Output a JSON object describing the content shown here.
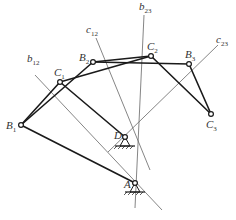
{
  "diagram": {
    "colors": {
      "link": "#1a1a1a",
      "construction": "#666666",
      "label": "#333333",
      "background": "#ffffff"
    },
    "points": {
      "B1": {
        "name": "B",
        "sub": "1",
        "x": 21,
        "y": 125
      },
      "C1": {
        "name": "C",
        "sub": "1",
        "x": 60,
        "y": 82
      },
      "B2": {
        "name": "B",
        "sub": "2",
        "x": 93,
        "y": 62
      },
      "C2": {
        "name": "C",
        "sub": "2",
        "x": 151,
        "y": 56
      },
      "B3": {
        "name": "B",
        "sub": "3",
        "x": 189,
        "y": 64
      },
      "C3": {
        "name": "C",
        "sub": "3",
        "x": 211,
        "y": 114
      },
      "D": {
        "name": "D",
        "sub": "",
        "x": 125,
        "y": 137
      },
      "A": {
        "name": "A",
        "sub": "",
        "x": 135,
        "y": 183
      }
    },
    "links": [
      {
        "from": "B1",
        "to": "C1",
        "type": "coupler"
      },
      {
        "from": "B2",
        "to": "C2",
        "type": "coupler"
      },
      {
        "from": "B3",
        "to": "C3",
        "type": "coupler"
      },
      {
        "from": "B1",
        "to": "A",
        "type": "crank"
      },
      {
        "from": "C1",
        "to": "D",
        "type": "rocker"
      },
      {
        "from": "B1",
        "to": "B2",
        "type": "chord"
      },
      {
        "from": "B2",
        "to": "B3",
        "type": "chord"
      },
      {
        "from": "C1",
        "to": "C2",
        "type": "chord"
      },
      {
        "from": "C2",
        "to": "C3",
        "type": "chord"
      }
    ],
    "bisectors": [
      {
        "label": "b",
        "sub": "12",
        "x1": 35,
        "y1": 75,
        "x2": 162,
        "y2": 210
      },
      {
        "label": "b",
        "sub": "23",
        "x1": 144,
        "y1": 15,
        "x2": 135,
        "y2": 208
      },
      {
        "label": "c",
        "sub": "12",
        "x1": 96,
        "y1": 38,
        "x2": 150,
        "y2": 170
      },
      {
        "label": "c",
        "sub": "23",
        "x1": 218,
        "y1": 45,
        "x2": 108,
        "y2": 152
      }
    ],
    "labels": [
      {
        "id": "B1",
        "text": "B",
        "sub": "1",
        "x": 6,
        "y": 129
      },
      {
        "id": "C1",
        "text": "C",
        "sub": "1",
        "x": 54,
        "y": 76
      },
      {
        "id": "B2",
        "text": "B",
        "sub": "2",
        "x": 79,
        "y": 61
      },
      {
        "id": "C2",
        "text": "C",
        "sub": "2",
        "x": 147,
        "y": 50
      },
      {
        "id": "B3",
        "text": "B",
        "sub": "3",
        "x": 185,
        "y": 58
      },
      {
        "id": "C3",
        "text": "C",
        "sub": "3",
        "x": 206,
        "y": 128
      },
      {
        "id": "D",
        "text": "D",
        "sub": "",
        "x": 114,
        "y": 139
      },
      {
        "id": "A",
        "text": "A",
        "sub": "",
        "x": 124,
        "y": 188
      },
      {
        "id": "b12",
        "text": "b",
        "sub": "12",
        "x": 27,
        "y": 62
      },
      {
        "id": "c12",
        "text": "c",
        "sub": "12",
        "x": 86,
        "y": 33
      },
      {
        "id": "b23",
        "text": "b",
        "sub": "23",
        "x": 139,
        "y": 10
      },
      {
        "id": "c23",
        "text": "c",
        "sub": "23",
        "x": 216,
        "y": 43
      }
    ],
    "supports": [
      {
        "at": "D"
      },
      {
        "at": "A"
      }
    ]
  }
}
